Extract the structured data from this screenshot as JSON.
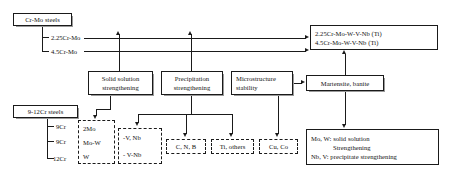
{
  "diagram": {
    "nodes": {
      "cr_mo_steels": "Cr-Mo steels",
      "cr_mo_leaf_1": "2.25Cr-Mo",
      "cr_mo_leaf_2": "4.5Cr-Mo",
      "nine_twelve_cr_steels": "9-12Cr steels",
      "cr_leaf_1": "9Cr",
      "cr_leaf_2": "9Cr",
      "cr_leaf_3": "12Cr",
      "target_1": "2.25Cr-Mo-W-V-Nb (Ti)",
      "target_2": "4.5Cr-Mo-W-V-Nb  (Ti)",
      "solid_solution_l1": "Solid solution",
      "solid_solution_l2": "strengthening",
      "precipitation_l1": "Precipitation",
      "precipitation_l2": "strengthening",
      "microstructure_l1": "Microstructure",
      "microstructure_l2": "stability",
      "martensite": "Martensite, banite",
      "elements_mo_1": "2Mo",
      "elements_mo_2": "Mo-W",
      "elements_mo_3": "W",
      "elements_vnb_1": "-V, Nb",
      "elements_vnb_2": "- V-Nb",
      "elements_cnb": "C, N, B",
      "elements_ti": "Ti, others",
      "elements_cuco": "Cu, Co",
      "summary_l1": "Mo, W: solid solution",
      "summary_l2": "Strengthening",
      "summary_l3": "Nb, V:  precipitate strengthening"
    },
    "colors": {
      "stroke": "#1a1a1a",
      "text": "#111111",
      "background": "#ffffff",
      "shadow": "#9a9a9a"
    }
  }
}
